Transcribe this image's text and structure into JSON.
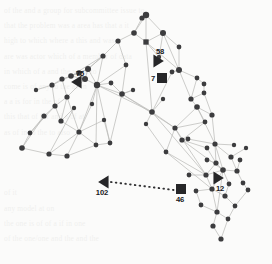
{
  "figure": {
    "title": "",
    "type": "network-graph",
    "background_color": "#fbfbfa",
    "node_color": "#3c3c3e",
    "edge_color": "#b9b9b6",
    "marker_color": "#262628",
    "label_color": "#18181a",
    "width": 272,
    "height": 264
  },
  "chart_data": {
    "type": "scatter",
    "title": "",
    "xlabel": "",
    "ylabel": "",
    "grid": false,
    "legend": "none",
    "nodes": [
      {
        "id": 0,
        "x": 146,
        "y": 15,
        "r": 3.2
      },
      {
        "id": 1,
        "x": 142,
        "y": 18,
        "r": 2.6
      },
      {
        "id": 2,
        "x": 163,
        "y": 33,
        "r": 3.0
      },
      {
        "id": 3,
        "x": 134,
        "y": 33,
        "r": 2.8
      },
      {
        "id": 4,
        "x": 146,
        "y": 42,
        "r": 2.8,
        "shape": "square"
      },
      {
        "id": 5,
        "x": 118,
        "y": 41,
        "r": 2.6
      },
      {
        "id": 6,
        "x": 179,
        "y": 47,
        "r": 2.4
      },
      {
        "id": 7,
        "x": 103,
        "y": 56,
        "r": 2.6
      },
      {
        "id": 8,
        "x": 179,
        "y": 70,
        "r": 3.0
      },
      {
        "id": 9,
        "x": 172,
        "y": 72,
        "r": 2.4
      },
      {
        "id": 10,
        "x": 126,
        "y": 65,
        "r": 2.4
      },
      {
        "id": 11,
        "x": 88,
        "y": 69,
        "r": 3.0
      },
      {
        "id": 12,
        "x": 79,
        "y": 73,
        "r": 2.8
      },
      {
        "id": 13,
        "x": 71,
        "y": 76,
        "r": 2.8
      },
      {
        "id": 14,
        "x": 85,
        "y": 79,
        "r": 3.0
      },
      {
        "id": 15,
        "x": 62,
        "y": 79,
        "r": 2.6
      },
      {
        "id": 16,
        "x": 52,
        "y": 85,
        "r": 2.6
      },
      {
        "id": 17,
        "x": 97,
        "y": 85,
        "r": 3.2
      },
      {
        "id": 18,
        "x": 111,
        "y": 83,
        "r": 2.4
      },
      {
        "id": 19,
        "x": 197,
        "y": 78,
        "r": 2.4
      },
      {
        "id": 20,
        "x": 204,
        "y": 84,
        "r": 2.4
      },
      {
        "id": 21,
        "x": 122,
        "y": 94,
        "r": 2.8
      },
      {
        "id": 22,
        "x": 67,
        "y": 97,
        "r": 2.6
      },
      {
        "id": 23,
        "x": 191,
        "y": 99,
        "r": 2.6
      },
      {
        "id": 24,
        "x": 197,
        "y": 107,
        "r": 2.8
      },
      {
        "id": 25,
        "x": 204,
        "y": 93,
        "r": 2.4
      },
      {
        "id": 26,
        "x": 55,
        "y": 106,
        "r": 2.6
      },
      {
        "id": 27,
        "x": 44,
        "y": 116,
        "r": 2.6
      },
      {
        "id": 28,
        "x": 61,
        "y": 121,
        "r": 2.6
      },
      {
        "id": 29,
        "x": 152,
        "y": 112,
        "r": 2.8
      },
      {
        "id": 30,
        "x": 212,
        "y": 115,
        "r": 2.6
      },
      {
        "id": 31,
        "x": 205,
        "y": 122,
        "r": 2.4
      },
      {
        "id": 32,
        "x": 175,
        "y": 128,
        "r": 2.6
      },
      {
        "id": 33,
        "x": 79,
        "y": 132,
        "r": 2.6
      },
      {
        "id": 34,
        "x": 30,
        "y": 133,
        "r": 2.4
      },
      {
        "id": 35,
        "x": 22,
        "y": 148,
        "r": 2.8
      },
      {
        "id": 36,
        "x": 49,
        "y": 154,
        "r": 2.6
      },
      {
        "id": 37,
        "x": 67,
        "y": 156,
        "r": 2.6
      },
      {
        "id": 38,
        "x": 96,
        "y": 145,
        "r": 2.4
      },
      {
        "id": 39,
        "x": 110,
        "y": 143,
        "r": 2.4
      },
      {
        "id": 40,
        "x": 182,
        "y": 140,
        "r": 2.6
      },
      {
        "id": 41,
        "x": 188,
        "y": 139,
        "r": 2.4
      },
      {
        "id": 42,
        "x": 215,
        "y": 144,
        "r": 2.6
      },
      {
        "id": 43,
        "x": 207,
        "y": 148,
        "r": 2.4
      },
      {
        "id": 44,
        "x": 166,
        "y": 152,
        "r": 2.4
      },
      {
        "id": 45,
        "x": 231,
        "y": 157,
        "r": 2.6
      },
      {
        "id": 46,
        "x": 216,
        "y": 163,
        "r": 2.6
      },
      {
        "id": 47,
        "x": 223,
        "y": 170,
        "r": 2.8
      },
      {
        "id": 48,
        "x": 237,
        "y": 171,
        "r": 2.6
      },
      {
        "id": 49,
        "x": 206,
        "y": 175,
        "r": 2.6
      },
      {
        "id": 50,
        "x": 243,
        "y": 183,
        "r": 2.4
      },
      {
        "id": 51,
        "x": 229,
        "y": 184,
        "r": 2.4
      },
      {
        "id": 52,
        "x": 212,
        "y": 189,
        "r": 2.6
      },
      {
        "id": 53,
        "x": 196,
        "y": 191,
        "r": 2.4
      },
      {
        "id": 54,
        "x": 225,
        "y": 196,
        "r": 2.6
      },
      {
        "id": 55,
        "x": 248,
        "y": 190,
        "r": 2.4
      },
      {
        "id": 56,
        "x": 201,
        "y": 205,
        "r": 2.4
      },
      {
        "id": 57,
        "x": 217,
        "y": 212,
        "r": 2.6
      },
      {
        "id": 58,
        "x": 235,
        "y": 206,
        "r": 2.4
      },
      {
        "id": 59,
        "x": 213,
        "y": 226,
        "r": 2.6
      },
      {
        "id": 60,
        "x": 228,
        "y": 219,
        "r": 2.4
      },
      {
        "id": 61,
        "x": 221,
        "y": 239,
        "r": 2.6
      },
      {
        "id": 62,
        "x": 207,
        "y": 160,
        "r": 2.4
      },
      {
        "id": 63,
        "x": 240,
        "y": 160,
        "r": 2.4
      },
      {
        "id": 64,
        "x": 189,
        "y": 175,
        "r": 2.4
      },
      {
        "id": 65,
        "x": 104,
        "y": 120,
        "r": 2.2
      },
      {
        "id": 66,
        "x": 133,
        "y": 90,
        "r": 2.2
      },
      {
        "id": 67,
        "x": 159,
        "y": 57,
        "r": 2.2
      },
      {
        "id": 68,
        "x": 92,
        "y": 104,
        "r": 2.2
      },
      {
        "id": 69,
        "x": 36,
        "y": 90,
        "r": 2.2
      },
      {
        "id": 70,
        "x": 74,
        "y": 108,
        "r": 2.2
      },
      {
        "id": 71,
        "x": 146,
        "y": 124,
        "r": 2.2
      },
      {
        "id": 72,
        "x": 163,
        "y": 99,
        "r": 2.2
      },
      {
        "id": 73,
        "x": 246,
        "y": 148,
        "r": 2.2
      },
      {
        "id": 74,
        "x": 234,
        "y": 145,
        "r": 2.2
      }
    ],
    "edges": [
      [
        0,
        1
      ],
      [
        0,
        2
      ],
      [
        0,
        3
      ],
      [
        0,
        4
      ],
      [
        1,
        3
      ],
      [
        2,
        4
      ],
      [
        2,
        6
      ],
      [
        3,
        5
      ],
      [
        3,
        4
      ],
      [
        4,
        8
      ],
      [
        4,
        67
      ],
      [
        5,
        7
      ],
      [
        5,
        10
      ],
      [
        6,
        8
      ],
      [
        7,
        11
      ],
      [
        7,
        17
      ],
      [
        8,
        9
      ],
      [
        8,
        19
      ],
      [
        8,
        23
      ],
      [
        9,
        29
      ],
      [
        10,
        17
      ],
      [
        10,
        21
      ],
      [
        11,
        12
      ],
      [
        11,
        13
      ],
      [
        11,
        14
      ],
      [
        11,
        17
      ],
      [
        12,
        13
      ],
      [
        12,
        14
      ],
      [
        13,
        15
      ],
      [
        13,
        16
      ],
      [
        14,
        17
      ],
      [
        14,
        22
      ],
      [
        15,
        16
      ],
      [
        15,
        22
      ],
      [
        16,
        26
      ],
      [
        17,
        18
      ],
      [
        17,
        21
      ],
      [
        17,
        33
      ],
      [
        17,
        68
      ],
      [
        18,
        21
      ],
      [
        19,
        20
      ],
      [
        19,
        23
      ],
      [
        20,
        25
      ],
      [
        21,
        29
      ],
      [
        21,
        66
      ],
      [
        22,
        26
      ],
      [
        22,
        28
      ],
      [
        23,
        24
      ],
      [
        23,
        25
      ],
      [
        24,
        30
      ],
      [
        24,
        31
      ],
      [
        24,
        32
      ],
      [
        25,
        30
      ],
      [
        26,
        27
      ],
      [
        26,
        28
      ],
      [
        27,
        34
      ],
      [
        28,
        33
      ],
      [
        28,
        70
      ],
      [
        29,
        32
      ],
      [
        29,
        71
      ],
      [
        30,
        42
      ],
      [
        31,
        32
      ],
      [
        31,
        40
      ],
      [
        32,
        40
      ],
      [
        32,
        44
      ],
      [
        33,
        37
      ],
      [
        33,
        38
      ],
      [
        34,
        35
      ],
      [
        35,
        36
      ],
      [
        36,
        37
      ],
      [
        37,
        38
      ],
      [
        38,
        39
      ],
      [
        39,
        65
      ],
      [
        40,
        41
      ],
      [
        40,
        43
      ],
      [
        41,
        42
      ],
      [
        42,
        45
      ],
      [
        42,
        46
      ],
      [
        43,
        46
      ],
      [
        44,
        49
      ],
      [
        45,
        48
      ],
      [
        46,
        47
      ],
      [
        46,
        62
      ],
      [
        47,
        49
      ],
      [
        47,
        48
      ],
      [
        47,
        51
      ],
      [
        47,
        52
      ],
      [
        48,
        50
      ],
      [
        49,
        52
      ],
      [
        49,
        64
      ],
      [
        50,
        55
      ],
      [
        51,
        54
      ],
      [
        52,
        53
      ],
      [
        52,
        54
      ],
      [
        52,
        57
      ],
      [
        53,
        56
      ],
      [
        54,
        58
      ],
      [
        55,
        58
      ],
      [
        56,
        57
      ],
      [
        57,
        59
      ],
      [
        57,
        60
      ],
      [
        58,
        60
      ],
      [
        59,
        61
      ],
      [
        60,
        61
      ],
      [
        63,
        48
      ],
      [
        73,
        45
      ],
      [
        74,
        42
      ],
      [
        72,
        29
      ],
      [
        66,
        21
      ],
      [
        65,
        33
      ],
      [
        69,
        16
      ],
      [
        7,
        13
      ],
      [
        17,
        29
      ],
      [
        21,
        32
      ],
      [
        29,
        49
      ],
      [
        17,
        39
      ],
      [
        4,
        29
      ],
      [
        2,
        8
      ],
      [
        33,
        36
      ],
      [
        11,
        7
      ],
      [
        24,
        42
      ],
      [
        47,
        57
      ],
      [
        14,
        12
      ],
      [
        13,
        14
      ],
      [
        40,
        47
      ],
      [
        32,
        49
      ],
      [
        44,
        52
      ],
      [
        9,
        8
      ],
      [
        67,
        2
      ],
      [
        68,
        33
      ],
      [
        70,
        36
      ],
      [
        71,
        44
      ],
      [
        35,
        27
      ],
      [
        22,
        33
      ],
      [
        26,
        34
      ],
      [
        21,
        39
      ],
      [
        17,
        38
      ],
      [
        42,
        47
      ],
      [
        46,
        49
      ]
    ],
    "markers": [
      {
        "label": "58",
        "shape": "triangle-right",
        "x": 158,
        "y": 61,
        "label_x": 160,
        "label_y": 51
      },
      {
        "label": "7",
        "shape": "square",
        "x": 162,
        "y": 78,
        "label_x": 153,
        "label_y": 78
      },
      {
        "label": "75",
        "shape": "triangle-left",
        "x": 77,
        "y": 82,
        "label_x": 80,
        "label_y": 73
      },
      {
        "label": "102",
        "shape": "triangle-left",
        "x": 104,
        "y": 182,
        "label_x": 102,
        "label_y": 192
      },
      {
        "label": "46",
        "shape": "square",
        "x": 181,
        "y": 189,
        "label_x": 180,
        "label_y": 199
      },
      {
        "label": "12",
        "shape": "triangle-right",
        "x": 218,
        "y": 178,
        "label_x": 220,
        "label_y": 188
      }
    ],
    "dotted_connection": {
      "from": [
        111,
        182
      ],
      "to": [
        174,
        190
      ],
      "style": "dotted"
    }
  },
  "background_text": {
    "visible": true,
    "description": "faint-scanned-page-bleedthrough",
    "lines": [
      "of the and   a group for subcommittee issue   to",
      "that the problem was a   area has that a  it",
      "high   to which where      a this and  was",
      "are was actor which  of    a member of data",
      "in which   of    a  and  the  work  to",
      "come is  of    any   to    the   as  in",
      "a   a     is    for  in  the   of",
      "this  that  of  for  and   a   of  at",
      "as  of  in    to   the    to   also",
      "",
      "",
      "",
      "of it",
      "any         model          at       on",
      "the  one  is  of     of  a  if  in  one",
      "of    the  one/one  and  the   and  the"
    ]
  }
}
